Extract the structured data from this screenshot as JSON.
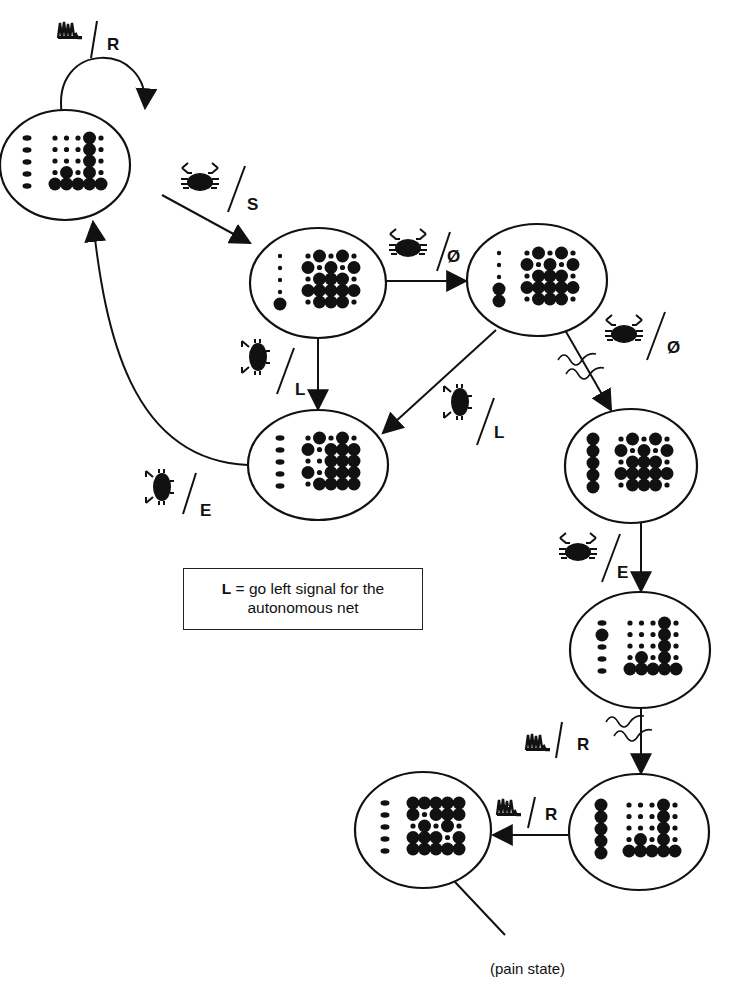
{
  "figure": {
    "background_color": "#ffffff",
    "ink_color": "#111111"
  },
  "states": [
    {
      "id": "s1",
      "name": "initial-state",
      "cx": 65,
      "cy": 165,
      "rx": 65,
      "ry": 55,
      "left_column": [
        "small",
        "small",
        "small",
        "small",
        "small"
      ],
      "grid_pattern": "histogram-tall-col4"
    },
    {
      "id": "s2",
      "name": "state-after-s",
      "cx": 318,
      "cy": 283,
      "rx": 68,
      "ry": 55,
      "left_column": [
        "tiny",
        "tiny",
        "tiny",
        "tiny",
        "large"
      ],
      "grid_pattern": "checker-dense"
    },
    {
      "id": "s3",
      "name": "state-after-null",
      "cx": 537,
      "cy": 280,
      "rx": 70,
      "ry": 56,
      "left_column": [
        "tiny",
        "tiny",
        "tiny",
        "large",
        "large"
      ],
      "grid_pattern": "checker-dense"
    },
    {
      "id": "s4",
      "name": "state-left",
      "cx": 318,
      "cy": 465,
      "rx": 70,
      "ry": 55,
      "left_column": [
        "small",
        "small",
        "small",
        "small",
        "small"
      ],
      "grid_pattern": "checker-right-heavy"
    },
    {
      "id": "s5",
      "name": "state-crab-null",
      "cx": 631,
      "cy": 466,
      "rx": 66,
      "ry": 57,
      "left_column": [
        "large",
        "large",
        "large",
        "large",
        "large"
      ],
      "grid_pattern": "checker-dense"
    },
    {
      "id": "s6",
      "name": "state-after-e",
      "cx": 640,
      "cy": 650,
      "rx": 70,
      "ry": 58,
      "left_column": [
        "small",
        "large",
        "small",
        "small",
        "small"
      ],
      "grid_pattern": "histogram-tall-col4"
    },
    {
      "id": "s7",
      "name": "state-before-pain",
      "cx": 639,
      "cy": 832,
      "rx": 70,
      "ry": 58,
      "left_column": [
        "large",
        "large",
        "large",
        "large",
        "large"
      ],
      "grid_pattern": "histogram-tall-col4"
    },
    {
      "id": "s8",
      "name": "pain-state",
      "cx": 423,
      "cy": 830,
      "rx": 68,
      "ry": 58,
      "left_column": [
        "small",
        "small",
        "small",
        "small",
        "small"
      ],
      "grid_pattern": "pain-dense"
    }
  ],
  "transitions": [
    {
      "from": "s1",
      "to": "s1",
      "stimulus": "spike-train",
      "output": "R"
    },
    {
      "from": "s1",
      "to": "s2",
      "stimulus": "crab",
      "output": "S"
    },
    {
      "from": "s2",
      "to": "s3",
      "stimulus": "crab",
      "output": "Ø"
    },
    {
      "from": "s2",
      "to": "s4",
      "stimulus": "beetle",
      "output": "L"
    },
    {
      "from": "s3",
      "to": "s4",
      "stimulus": "beetle",
      "output": "L"
    },
    {
      "from": "s3",
      "to": "s5",
      "stimulus": "crab",
      "output": "Ø",
      "delayed": true
    },
    {
      "from": "s4",
      "to": "s1",
      "stimulus": "beetle",
      "output": "E"
    },
    {
      "from": "s5",
      "to": "s6",
      "stimulus": "crab",
      "output": "E"
    },
    {
      "from": "s6",
      "to": "s7",
      "stimulus": "spike-train",
      "output": "R",
      "delayed": true
    },
    {
      "from": "s7",
      "to": "s8",
      "stimulus": "spike-train",
      "output": "R"
    }
  ],
  "labels": {
    "s1_loop": "R",
    "s1_s2": "S",
    "s2_s3": "Ø",
    "s2_s4": "L",
    "s3_s4": "L",
    "s3_s5": "Ø",
    "s4_s1": "E",
    "s5_s6": "E",
    "s6_s7": "R",
    "s7_s8": "R"
  },
  "legend": {
    "key": "L",
    "text_line1": " = go left signal for the",
    "text_line2": "autonomous net"
  },
  "annotation": {
    "pain_state": "(pain state)"
  }
}
